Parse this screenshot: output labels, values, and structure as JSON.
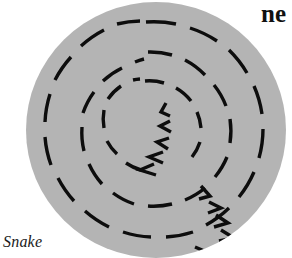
{
  "figure": {
    "name": "snake-contour-stimulus",
    "canvas": {
      "width": 292,
      "height": 258
    },
    "background_color": "#ffffff",
    "aperture": {
      "shape": "circle",
      "fill_color": "#b4b4b4",
      "center_x": 156,
      "center_y": 130,
      "radius_x": 130,
      "radius_y": 128
    },
    "element_color": "#0d0d0d",
    "element_stroke_width": 3.4,
    "distractor_rings": [
      {
        "radius": 108,
        "dash_count": 20,
        "label": "outer-ring"
      },
      {
        "radius": 78,
        "dash_count": 16,
        "label": "middle-ring"
      },
      {
        "radius": 50,
        "dash_count": 12,
        "label": "inner-ring"
      }
    ],
    "snake_contour": {
      "label": "snake",
      "element_count": 11,
      "description": "chevron elements aligned along a curved path from aperture centre to lower-right edge"
    }
  },
  "labels": {
    "figure_label": "Snake",
    "cropped_heading_fragment": "ne"
  }
}
